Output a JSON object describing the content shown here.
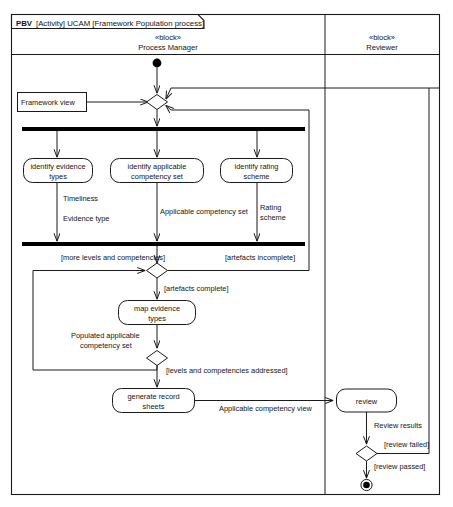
{
  "diagram": {
    "kind": "uml-activity-diagram",
    "title": {
      "prefix": "PBV",
      "rest": "[Activity] UCAM [Framework Population process]",
      "full": "PBV [Activity] UCAM [Framework Population process]"
    },
    "colors": {
      "stroke": "#1a1a1a",
      "fill": "#ffffff",
      "bar": "#000000",
      "text": "#141414"
    },
    "swimlanes": [
      {
        "id": "process-manager",
        "stereotype": "«block»",
        "name": "Process Manager"
      },
      {
        "id": "reviewer",
        "stereotype": "«block»",
        "name": "Reviewer"
      }
    ],
    "object_nodes": [
      {
        "id": "framework-view",
        "label": "Framework view"
      }
    ],
    "actions": [
      {
        "id": "identify-evidence-types",
        "line1": "identify evidence",
        "line2": "types"
      },
      {
        "id": "identify-applicable-competency-set",
        "line1": "identify applicable",
        "line2": "competency set"
      },
      {
        "id": "identify-rating-scheme",
        "line1": "identify rating",
        "line2": "scheme"
      },
      {
        "id": "map-evidence-types",
        "line1": "map evidence",
        "line2": "types"
      },
      {
        "id": "generate-record-sheets",
        "line1": "generate record",
        "line2": "sheets"
      },
      {
        "id": "review",
        "line1": "review",
        "line2": ""
      }
    ],
    "flow_labels": [
      {
        "id": "timeliness",
        "text": "Timeliness"
      },
      {
        "id": "evidence-type",
        "text": "Evidence type"
      },
      {
        "id": "applicable-competency-set",
        "text": "Applicable competency set"
      },
      {
        "id": "rating-scheme-l1",
        "text": "Rating"
      },
      {
        "id": "rating-scheme-l2",
        "text": "scheme"
      },
      {
        "id": "populated-applicable-l1",
        "text": "Populated applicable"
      },
      {
        "id": "populated-applicable-l2",
        "text": "competency set"
      },
      {
        "id": "applicable-competency-view",
        "text": "Applicable competency view"
      },
      {
        "id": "review-results",
        "text": "Review results"
      }
    ],
    "guards": [
      {
        "id": "more-levels-and-competencies",
        "text": "[more levels and competencies]"
      },
      {
        "id": "artefacts-incomplete",
        "text": "[artefacts incomplete]"
      },
      {
        "id": "artefacts-complete",
        "text": "[artefacts complete]"
      },
      {
        "id": "levels-and-competencies-addressed",
        "text": "[levels and competencies addressed]"
      },
      {
        "id": "review-failed",
        "text": "[review failed]"
      },
      {
        "id": "review-passed",
        "text": "[review passed]"
      }
    ],
    "control_nodes": [
      {
        "id": "initial-node",
        "type": "initial"
      },
      {
        "id": "merge-node-start",
        "type": "merge"
      },
      {
        "id": "fork-bar-top",
        "type": "fork"
      },
      {
        "id": "join-bar-bottom",
        "type": "join"
      },
      {
        "id": "decision-artefacts",
        "type": "decision"
      },
      {
        "id": "decision-levels",
        "type": "decision"
      },
      {
        "id": "decision-review",
        "type": "decision"
      },
      {
        "id": "final-node",
        "type": "activity-final"
      }
    ]
  }
}
